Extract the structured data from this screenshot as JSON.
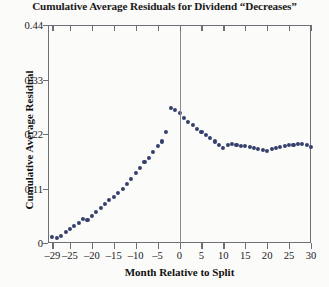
{
  "chart_data": {
    "type": "scatter",
    "title": "Cumulative Average Residuals for Dividend “Decreases”",
    "xlabel": "Month Relative to Split",
    "ylabel": "Cumulative Average Residual",
    "xlim": [
      -30,
      30
    ],
    "ylim": [
      0,
      0.44
    ],
    "grid": false,
    "legend": null,
    "xticks": [
      -29,
      -25,
      -20,
      -15,
      -10,
      -5,
      0,
      5,
      10,
      15,
      20,
      25,
      30
    ],
    "xtick_labels": [
      "–29",
      "–25",
      "–20",
      "–15",
      "–10",
      "–5",
      "0",
      "5",
      "10",
      "15",
      "20",
      "25",
      "30"
    ],
    "yticks": [
      0,
      0.11,
      0.22,
      0.33,
      0.44
    ],
    "ytick_labels": [
      "0",
      "0.11",
      "0.22",
      "0.33",
      "0.44"
    ],
    "point_color": "#343f6b",
    "axis_color": "#6e6e78",
    "reference_line_x": 0,
    "x": [
      -29,
      -28,
      -27,
      -26,
      -25,
      -24,
      -23,
      -22,
      -21,
      -20,
      -19,
      -18,
      -17,
      -16,
      -15,
      -14,
      -13,
      -12,
      -11,
      -10,
      -9,
      -8,
      -7,
      -6,
      -5,
      -4,
      -3,
      -2,
      -1,
      0,
      1,
      2,
      3,
      4,
      5,
      6,
      7,
      8,
      9,
      10,
      11,
      12,
      13,
      14,
      15,
      16,
      17,
      18,
      19,
      20,
      21,
      22,
      23,
      24,
      25,
      26,
      27,
      28,
      29,
      30
    ],
    "y": [
      0.012,
      0.01,
      0.014,
      0.022,
      0.028,
      0.035,
      0.04,
      0.048,
      0.047,
      0.055,
      0.062,
      0.07,
      0.078,
      0.086,
      0.093,
      0.101,
      0.11,
      0.12,
      0.13,
      0.141,
      0.152,
      0.163,
      0.172,
      0.183,
      0.195,
      0.205,
      0.224,
      0.272,
      0.268,
      0.262,
      0.253,
      0.245,
      0.238,
      0.23,
      0.224,
      0.218,
      0.212,
      0.205,
      0.198,
      0.192,
      0.197,
      0.2,
      0.198,
      0.196,
      0.195,
      0.193,
      0.191,
      0.19,
      0.188,
      0.186,
      0.19,
      0.192,
      0.194,
      0.196,
      0.198,
      0.197,
      0.2,
      0.199,
      0.197,
      0.194
    ]
  }
}
